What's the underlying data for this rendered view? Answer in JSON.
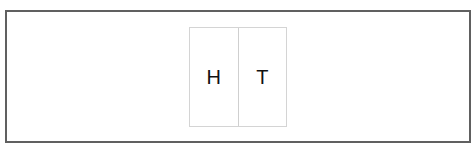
{
  "coin": {
    "faces": [
      {
        "label": "H"
      },
      {
        "label": "T"
      }
    ]
  },
  "colors": {
    "frame_border": "#606060",
    "card_border": "#d4d4d4",
    "text": "#111111"
  }
}
